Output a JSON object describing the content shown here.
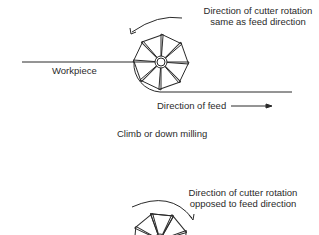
{
  "figure_top": {
    "rotation_label_line1": "Direction of cutter rotation",
    "rotation_label_line2": "same as feed direction",
    "workpiece_label": "Workpiece",
    "feed_label": "Direction of feed",
    "caption": "Climb or down milling"
  },
  "figure_bottom": {
    "rotation_label_line1": "Direction of cutter rotation",
    "rotation_label_line2": "opposed to feed direction"
  },
  "colors": {
    "line": "#2a2a2a",
    "background": "#ffffff"
  }
}
